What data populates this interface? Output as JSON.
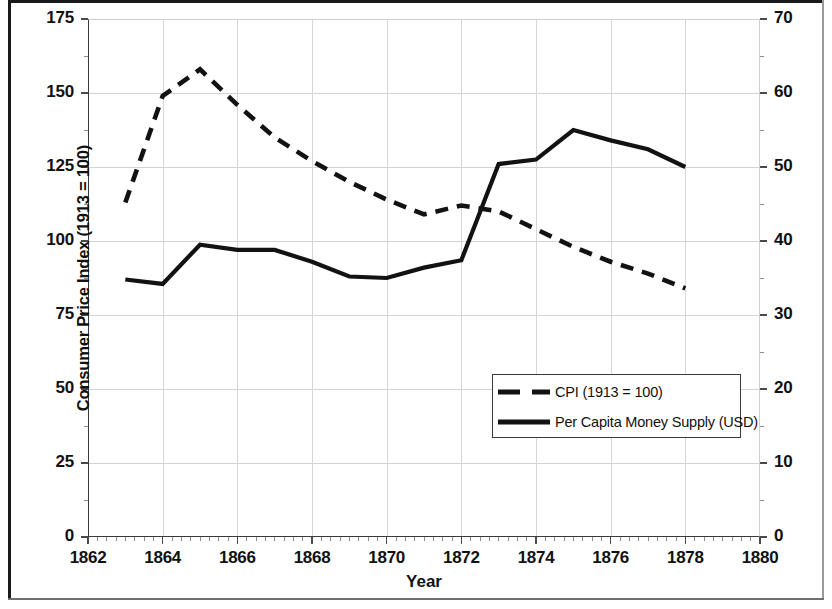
{
  "chart_data": {
    "type": "line",
    "title": "",
    "xlabel": "Year",
    "ylabel": "Consumer Price Index (1913 = 100)",
    "y2label": "Per-Capita Money Supply ($)",
    "xlim": [
      1862,
      1880
    ],
    "xticks": [
      1862,
      1864,
      1866,
      1868,
      1870,
      1872,
      1874,
      1876,
      1878,
      1880
    ],
    "ylim": [
      0,
      175
    ],
    "yticks": [
      0,
      25,
      50,
      75,
      100,
      125,
      150,
      175
    ],
    "y2lim": [
      0,
      70
    ],
    "y2ticks": [
      0,
      10,
      20,
      30,
      40,
      50,
      60,
      70
    ],
    "grid": true,
    "legend_position": "center-right",
    "x": [
      1863,
      1864,
      1865,
      1866,
      1867,
      1868,
      1869,
      1870,
      1871,
      1872,
      1873,
      1874,
      1875,
      1876,
      1877,
      1878
    ],
    "series": [
      {
        "name": "CPI (1913 = 100)",
        "axis": "left",
        "style": "dashed",
        "color": "#121212",
        "values": [
          113,
          149,
          158,
          146,
          135,
          127,
          120,
          114,
          109,
          112,
          110,
          104,
          98,
          93,
          89,
          84
        ]
      },
      {
        "name": "Per Capita Money Supply (USD)",
        "axis": "right",
        "style": "solid",
        "color": "#121212",
        "values": [
          34.8,
          34.2,
          39.5,
          38.8,
          38.8,
          37.2,
          35.2,
          35.0,
          36.4,
          37.4,
          50.4,
          51.0,
          55.0,
          53.6,
          52.4,
          50.0
        ]
      }
    ]
  },
  "axes": {
    "y_left": {
      "title": "Consumer Price Index (1913 = 100)",
      "tick_labels": [
        "175",
        "150",
        "125",
        "100",
        "75",
        "50",
        "25",
        "0"
      ]
    },
    "y_right": {
      "title": "Per-Capita Money Supply ($)",
      "tick_labels": [
        "70",
        "60",
        "50",
        "40",
        "30",
        "20",
        "10",
        "0"
      ]
    },
    "x": {
      "title": "Year",
      "tick_labels": [
        "1862",
        "1864",
        "1866",
        "1868",
        "1870",
        "1872",
        "1874",
        "1876",
        "1878",
        "1880"
      ]
    }
  },
  "legend": {
    "items": [
      {
        "label": "CPI (1913 = 100)",
        "style": "dashed"
      },
      {
        "label": "Per Capita Money Supply (USD)",
        "style": "solid"
      }
    ]
  }
}
